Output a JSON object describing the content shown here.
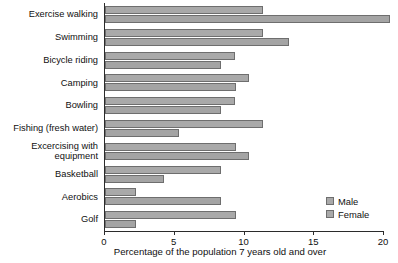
{
  "chart_data": {
    "type": "bar",
    "orientation": "horizontal",
    "title": "",
    "xlabel": "Percentage of the population 7 years old and over",
    "ylabel": "",
    "xlim": [
      0,
      20
    ],
    "xticks": [
      0,
      5,
      10,
      15,
      20
    ],
    "xtick_labels": [
      "0",
      "5",
      "10",
      "15",
      "20"
    ],
    "grid": false,
    "legend_position": "bottom-right",
    "categories": [
      "Exercise walking",
      "Swimming",
      "Bicycle riding",
      "Camping",
      "Bowling",
      "Fishing (fresh water)",
      "Excercising with\nequipment",
      "Basketball",
      "Aerobics",
      "Golf"
    ],
    "series": [
      {
        "name": "Male",
        "color": "#a9a9a9",
        "values": [
          11.3,
          11.3,
          9.3,
          10.3,
          9.3,
          11.3,
          9.4,
          8.3,
          2.2,
          9.4
        ]
      },
      {
        "name": "Female",
        "color": "#a4a4a4",
        "values": [
          20.4,
          13.2,
          8.3,
          9.4,
          8.3,
          5.3,
          10.3,
          4.2,
          8.3,
          2.2
        ]
      }
    ]
  },
  "legend": {
    "items": [
      {
        "label": "Male"
      },
      {
        "label": "Female"
      }
    ]
  }
}
